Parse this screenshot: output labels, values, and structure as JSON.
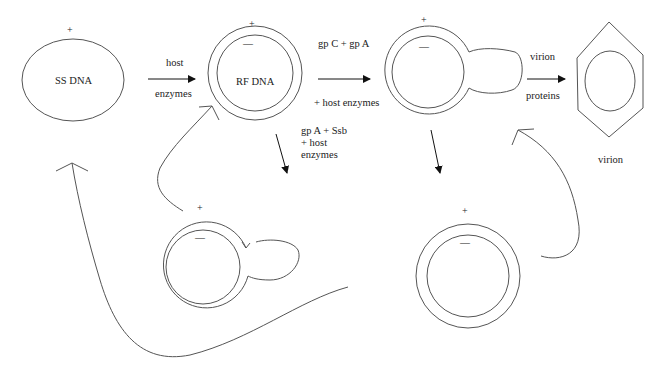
{
  "diagram": {
    "colors": {
      "stroke": "#555555",
      "arrow": "#111111",
      "text": "#222222",
      "background": "#ffffff"
    },
    "nodes": {
      "ss_dna": {
        "label": "SS DNA",
        "plus": "+"
      },
      "rf_dna": {
        "label": "RF DNA",
        "plus": "+",
        "minus": "—"
      },
      "rolling_circle_top": {
        "plus": "+",
        "minus": "—"
      },
      "virion": {
        "label": "virion"
      },
      "rolling_circle_bottom": {
        "plus": "+",
        "minus": "—"
      },
      "rf_bottom_right": {
        "plus": "+",
        "minus": "—"
      }
    },
    "edges": {
      "ss_to_rf": {
        "above": "host",
        "below": "enzymes"
      },
      "rf_to_rolling": {
        "above": "gp C + gp A",
        "below": "+ host enzymes"
      },
      "rf_down": {
        "line1": "gp A + Ssb",
        "line2": "+ host",
        "line3": "enzymes"
      },
      "rolling_to_virion": {
        "above": "virion",
        "below": "proteins"
      }
    }
  }
}
